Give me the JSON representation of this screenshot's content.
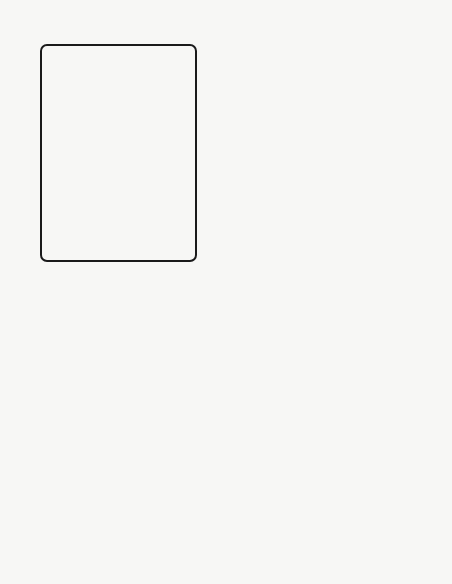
{
  "map": {
    "title": "VAUCLUSE",
    "orientation": "rotated 90 degrees counter-clockwise",
    "colors": {
      "paper": "#f7f7f5",
      "hatch": "#6e6e6e",
      "ink": "#1a1a1a",
      "land": "#ffffff",
      "inset_outside": "#8a8a8a",
      "inset_highlight": "#111111"
    },
    "inset": {
      "country_label": "FRANCE",
      "region_label": "VAUCLUSE"
    },
    "towns": [
      {
        "id": "orange",
        "label": "ORANGE"
      },
      {
        "id": "carpentras",
        "label": "CARPENTRAS"
      },
      {
        "id": "pernes",
        "label": "PERNES"
      },
      {
        "id": "avignon",
        "label": "AVIGNON"
      },
      {
        "id": "fontaine",
        "label_line1": "FONTAINE DE",
        "label_line2": "VAUCLUSE"
      },
      {
        "id": "cavaillon",
        "label": "CAVAILLON"
      },
      {
        "id": "gordes",
        "label": "GORDES"
      },
      {
        "id": "st-saturnin",
        "label": "ST. SATURNIN"
      },
      {
        "id": "roussillon",
        "label": "ROUSSILLON"
      },
      {
        "id": "peyrane",
        "label": "PEYRANE"
      },
      {
        "id": "goult",
        "label": "GOULT"
      },
      {
        "id": "apt",
        "label": "APT"
      },
      {
        "id": "bonnieux",
        "label": "BONNIEUX"
      },
      {
        "id": "manosque",
        "label": "MANOSQUE"
      },
      {
        "id": "les-baux",
        "label": "LES BAUX"
      },
      {
        "id": "arles",
        "label": "ARLES"
      }
    ],
    "features": [
      {
        "id": "mont-ventoux",
        "label": "MONT VENTOUX"
      },
      {
        "id": "monts-de-vaucluse",
        "label": "MONTS DE VAUCLUSE"
      },
      {
        "id": "montagne-du-luberon",
        "label": "MONTAGNE DU LUBERON"
      }
    ],
    "rivers": [
      {
        "id": "calavon",
        "label": "Calavon"
      },
      {
        "id": "durance",
        "label": "Durance"
      },
      {
        "id": "rhone",
        "label": "RHÔNE"
      }
    ]
  }
}
